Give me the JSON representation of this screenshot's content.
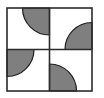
{
  "figure": {
    "type": "geometric-pattern",
    "canvas": {
      "width": 104,
      "height": 98
    },
    "colors": {
      "background": "#ffffff",
      "fill_white": "#ffffff",
      "fill_gray": "#7f7f7f",
      "stroke": "#2b2b2b",
      "arc_stroke": "#1e1e1e"
    },
    "frame": {
      "x": 7,
      "y": 8,
      "width": 85,
      "height": 83,
      "stroke_width": 1.6,
      "label": "outer-square-border"
    },
    "divider": {
      "vertical_x": 49.5,
      "horizontal_y": 49.5,
      "stroke_width": 1.6,
      "label": "quadrant-cross-divider"
    },
    "quadrants": [
      {
        "id": "top-left",
        "label": "Top-left quadrant",
        "x": 7,
        "y": 8,
        "width": 42.5,
        "height": 41.5,
        "arc_corner": "top-right",
        "arc_center": {
          "x": 49.5,
          "y": 8
        },
        "arc_radius": 27,
        "arc_fill": "#7f7f7f"
      },
      {
        "id": "top-right",
        "label": "Top-right quadrant",
        "x": 49.5,
        "y": 8,
        "width": 42.5,
        "height": 41.5,
        "arc_corner": "bottom-right",
        "arc_center": {
          "x": 92,
          "y": 49.5
        },
        "arc_radius": 27,
        "arc_fill": "#7f7f7f"
      },
      {
        "id": "bottom-left",
        "label": "Bottom-left quadrant",
        "x": 7,
        "y": 49.5,
        "width": 42.5,
        "height": 41.5,
        "arc_corner": "top-left",
        "arc_center": {
          "x": 7,
          "y": 49.5
        },
        "arc_radius": 27,
        "arc_fill": "#7f7f7f"
      },
      {
        "id": "bottom-right",
        "label": "Bottom-right quadrant",
        "x": 49.5,
        "y": 49.5,
        "width": 42.5,
        "height": 41.5,
        "arc_corner": "bottom-left",
        "arc_center": {
          "x": 49.5,
          "y": 91
        },
        "arc_radius": 27,
        "arc_fill": "#7f7f7f"
      }
    ]
  }
}
